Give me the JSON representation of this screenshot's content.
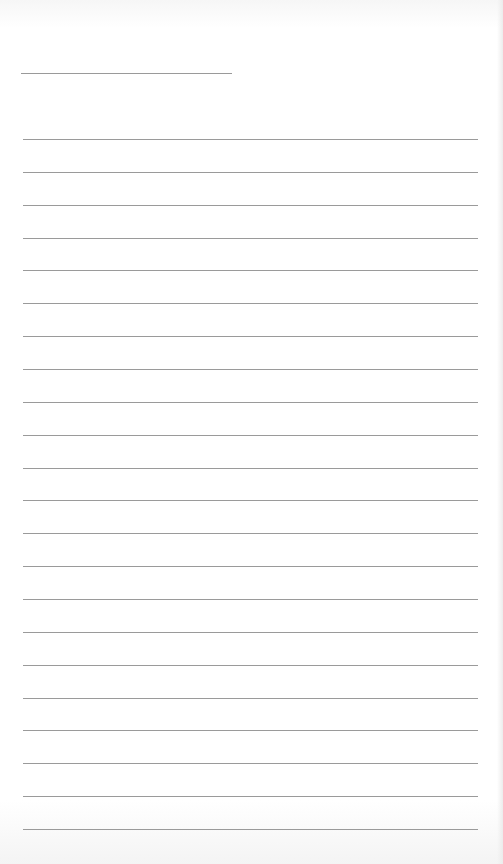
{
  "page": {
    "type": "lined-paper",
    "background_color": "#ffffff",
    "line_color": "#9a9a9a",
    "header_line": {
      "y": 73,
      "x_start": 21,
      "x_end": 232
    },
    "ruled_lines": {
      "count": 22,
      "first_y": 139,
      "spacing": 32.86,
      "x_start": 23,
      "x_end": 478
    }
  }
}
